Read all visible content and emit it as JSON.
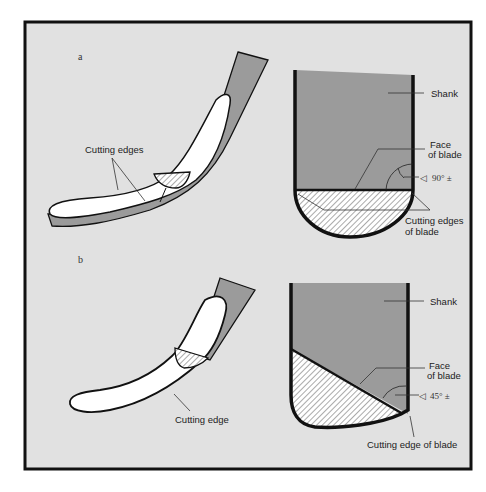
{
  "figure": {
    "colors": {
      "background": "#e1e1e1",
      "frame": "#111111",
      "shank": "#9b9b9b",
      "blade_face": "#ffffff",
      "outline": "#111111"
    },
    "panel_a": {
      "letter": "a",
      "side_view": {
        "label_cutting_edges": "Cutting edges"
      },
      "front_view": {
        "label_shank": "Shank",
        "label_face_line1": "Face",
        "label_face_line2": "of blade",
        "angle_symbol": "◁",
        "angle_value": "90° ±",
        "label_cutting_edges_line1": "Cutting edges",
        "label_cutting_edges_line2": "of blade"
      }
    },
    "panel_b": {
      "letter": "b",
      "side_view": {
        "label_cutting_edge": "Cutting edge"
      },
      "front_view": {
        "label_shank": "Shank",
        "label_face_line1": "Face",
        "label_face_line2": "of blade",
        "angle_symbol": "◁",
        "angle_value": "45° ±",
        "label_cutting_edge": "Cutting edge of blade"
      }
    }
  }
}
